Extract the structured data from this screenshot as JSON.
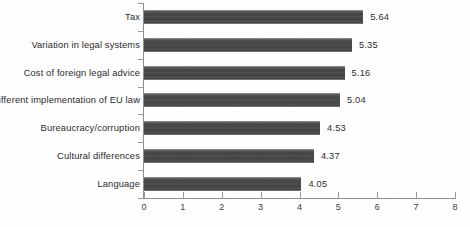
{
  "chart_data": {
    "type": "bar",
    "orientation": "horizontal",
    "title": "",
    "xlabel": "",
    "ylabel": "",
    "xlim": [
      0,
      8
    ],
    "xticks": [
      "0",
      "1",
      "2",
      "3",
      "4",
      "5",
      "6",
      "7",
      "8"
    ],
    "grid": false,
    "legend": "none",
    "categories": [
      "Tax",
      "Variation in legal systems",
      "Cost of foreign legal advice",
      "Different implementation of EU law",
      "Bureaucracy/corruption",
      "Cultural differences",
      "Language"
    ],
    "values": [
      5.64,
      5.35,
      5.16,
      5.04,
      4.53,
      4.37,
      4.05
    ],
    "value_labels": [
      "5.64",
      "5.35",
      "5.16",
      "5.04",
      "4.53",
      "4.37",
      "4.05"
    ],
    "bar_color": "#4c4c4c",
    "axis_color": "#8d8d8d",
    "background_color": "#fefefe"
  }
}
